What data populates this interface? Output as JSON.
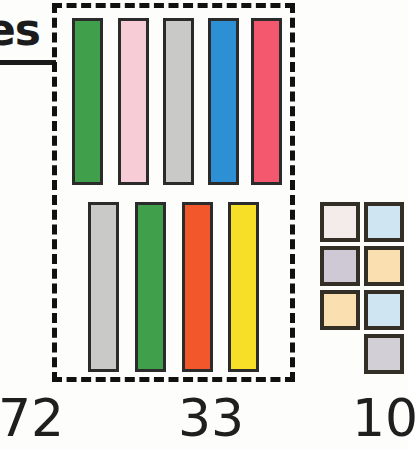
{
  "heading": {
    "partial_text": "es"
  },
  "group_box": {
    "label": "dashed-grouping-box",
    "border_style": "dashed",
    "border_color": "#111111"
  },
  "top_row": {
    "label": "top-bar-row",
    "count": 5,
    "bars": [
      {
        "name": "bar-green",
        "color": "#3f9f4b",
        "x": 72,
        "y": 18,
        "w": 31,
        "h": 167
      },
      {
        "name": "bar-pink",
        "color": "#f8ccd7",
        "x": 118,
        "y": 18,
        "w": 31,
        "h": 167
      },
      {
        "name": "bar-gray",
        "color": "#c9c9c7",
        "x": 163,
        "y": 18,
        "w": 31,
        "h": 167
      },
      {
        "name": "bar-blue",
        "color": "#2d8fd4",
        "x": 208,
        "y": 18,
        "w": 31,
        "h": 167
      },
      {
        "name": "bar-red",
        "color": "#f4586f",
        "x": 251,
        "y": 18,
        "w": 31,
        "h": 167
      }
    ]
  },
  "bottom_row": {
    "label": "bottom-bar-row",
    "count": 4,
    "bars": [
      {
        "name": "bar-gray",
        "color": "#c9c9c7",
        "x": 88,
        "y": 202,
        "w": 31,
        "h": 170
      },
      {
        "name": "bar-green",
        "color": "#3f9f4b",
        "x": 135,
        "y": 202,
        "w": 31,
        "h": 170
      },
      {
        "name": "bar-orange",
        "color": "#f1572a",
        "x": 182,
        "y": 202,
        "w": 31,
        "h": 170
      },
      {
        "name": "bar-yellow",
        "color": "#f7df27",
        "x": 228,
        "y": 202,
        "w": 31,
        "h": 170
      }
    ]
  },
  "chip_grid": {
    "label": "small-square-grid",
    "count": 7,
    "chips": [
      {
        "name": "chip-pale-pink",
        "color": "#f4ecea",
        "x": 320,
        "y": 202,
        "size": 40
      },
      {
        "name": "chip-light-blue",
        "color": "#cfe6f2",
        "x": 364,
        "y": 202,
        "size": 40
      },
      {
        "name": "chip-lavender",
        "color": "#cfc9d6",
        "x": 320,
        "y": 246,
        "size": 40
      },
      {
        "name": "chip-peach",
        "color": "#fadfb0",
        "x": 364,
        "y": 246,
        "size": 40
      },
      {
        "name": "chip-peach-2",
        "color": "#fadfb0",
        "x": 320,
        "y": 290,
        "size": 40
      },
      {
        "name": "chip-light-blue-2",
        "color": "#cfe6f2",
        "x": 364,
        "y": 290,
        "size": 40
      },
      {
        "name": "chip-gray",
        "color": "#d2cfd6",
        "x": 364,
        "y": 334,
        "size": 40
      }
    ]
  },
  "counts": [
    {
      "name": "count-left",
      "value": "72",
      "x": -2
    },
    {
      "name": "count-center",
      "value": "33",
      "x": 178
    },
    {
      "name": "count-right",
      "value": "10",
      "x": 352
    }
  ]
}
